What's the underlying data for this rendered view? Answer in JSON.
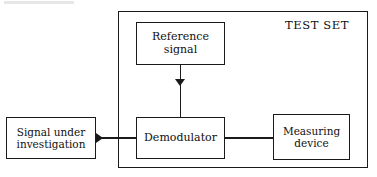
{
  "diagram": {
    "canvas": {
      "width": 377,
      "height": 177
    },
    "colors": {
      "background": "#ffffff",
      "stroke": "#1a1a1a",
      "text": "#101010",
      "smudge": "#cfcfcf"
    },
    "enclosure": {
      "label": "TEST SET",
      "name": "test-set"
    },
    "nodes": [
      {
        "id": "reference-signal",
        "label": "Reference\nsignal",
        "inside_enclosure": true
      },
      {
        "id": "demodulator",
        "label": "Demodulator",
        "inside_enclosure": true
      },
      {
        "id": "measuring-device",
        "label": "Measuring\ndevice",
        "inside_enclosure": true
      },
      {
        "id": "signal-under-investigation",
        "label": "Signal under\ninvestigation",
        "inside_enclosure": false
      }
    ],
    "edges": [
      {
        "id": "reference-to-demodulator",
        "from": "reference-signal",
        "to": "demodulator",
        "direction": "down",
        "arrowhead": true
      },
      {
        "id": "signal-to-demodulator",
        "from": "signal-under-investigation",
        "to": "demodulator",
        "direction": "right",
        "arrowhead": true
      },
      {
        "id": "demodulator-to-measuring",
        "from": "demodulator",
        "to": "measuring-device",
        "direction": "right",
        "arrowhead": false
      }
    ]
  }
}
